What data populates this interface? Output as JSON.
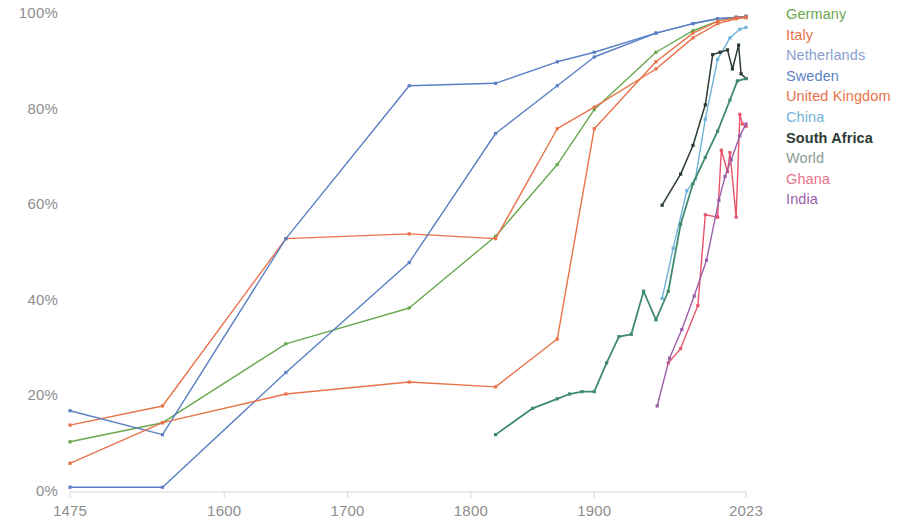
{
  "chart_data": {
    "type": "line",
    "title": "",
    "subtitle": "",
    "xlabel": "",
    "ylabel": "",
    "xlim": [
      1475,
      2023
    ],
    "ylim": [
      0,
      100
    ],
    "grid": false,
    "axis_line_color": "#d8d8d8",
    "tick_label_color": "#8e8e8e",
    "legend_position": "right",
    "x_ticks": [
      1475,
      1600,
      1700,
      1800,
      1900,
      2023
    ],
    "x_tick_labels": [
      "1475",
      "1600",
      "1700",
      "1800",
      "1900",
      "2023"
    ],
    "y_ticks": [
      0,
      20,
      40,
      60,
      80,
      100
    ],
    "y_tick_labels": [
      "0%",
      "20%",
      "40%",
      "60%",
      "80%",
      "100%"
    ],
    "series": [
      {
        "name": "Germany",
        "color": "#6aa84f",
        "width": 1.4,
        "x": [
          1475,
          1550,
          1650,
          1750,
          1820,
          1870,
          1900,
          1950,
          1980,
          2000,
          2015,
          2023
        ],
        "y": [
          10.5,
          14.5,
          31.0,
          38.5,
          53.5,
          68.5,
          80.0,
          92.0,
          96.5,
          98.5,
          99.3,
          99.5
        ]
      },
      {
        "name": "Italy",
        "color": "#e8734a",
        "width": 1.4,
        "x": [
          1475,
          1550,
          1650,
          1750,
          1820,
          1870,
          1900,
          1950,
          1980,
          2000,
          2015,
          2023
        ],
        "y": [
          14.0,
          18.0,
          53.0,
          54.0,
          53.0,
          76.0,
          80.5,
          88.5,
          95.0,
          98.0,
          99.0,
          99.2
        ]
      },
      {
        "name": "Netherlands",
        "color": "#5b7fc4",
        "width": 1.4,
        "x": [
          1475,
          1550,
          1650,
          1750,
          1820,
          1870,
          1900,
          1950,
          1980,
          2000,
          2015,
          2023
        ],
        "y": [
          17.0,
          12.0,
          53.0,
          85.0,
          85.5,
          90.0,
          92.0,
          96.0,
          98.0,
          99.0,
          99.3,
          99.5
        ]
      },
      {
        "name": "Sweden",
        "color": "#5b7fc4",
        "width": 1.4,
        "x": [
          1475,
          1550,
          1650,
          1750,
          1820,
          1870,
          1900,
          1950,
          1980,
          2000,
          2015,
          2023
        ],
        "y": [
          1.0,
          1.0,
          25.0,
          48.0,
          75.0,
          85.0,
          91.0,
          96.0,
          98.0,
          99.0,
          99.3,
          99.5
        ]
      },
      {
        "name": "United Kingdom",
        "color": "#e8734a",
        "width": 1.4,
        "x": [
          1475,
          1550,
          1650,
          1750,
          1820,
          1870,
          1900,
          1950,
          1980,
          2000,
          2015,
          2023
        ],
        "y": [
          6.0,
          14.5,
          20.5,
          23.0,
          22.0,
          32.0,
          76.0,
          90.0,
          96.0,
          98.5,
          99.2,
          99.4
        ]
      },
      {
        "name": "China",
        "color": "#6fb3d9",
        "width": 1.4,
        "x": [
          1955,
          1964,
          1975,
          1982,
          1990,
          2000,
          2010,
          2018,
          2023
        ],
        "y": [
          40.5,
          51.0,
          63.0,
          65.5,
          78.0,
          90.5,
          95.0,
          96.8,
          97.2
        ]
      },
      {
        "name": "South Africa",
        "color": "#2c3b33",
        "width": 1.5,
        "x": [
          1955,
          1970,
          1980,
          1990,
          1996,
          2002,
          2008,
          2012,
          2017,
          2019,
          2023
        ],
        "y": [
          60.0,
          66.5,
          72.5,
          81.0,
          91.5,
          92.0,
          92.5,
          88.5,
          93.5,
          87.5,
          86.5
        ]
      },
      {
        "name": "World",
        "color": "#3e8a6e",
        "width": 1.8,
        "x": [
          1820,
          1850,
          1870,
          1880,
          1890,
          1900,
          1910,
          1920,
          1930,
          1940,
          1950,
          1960,
          1970,
          1980,
          1990,
          2000,
          2010,
          2016,
          2023
        ],
        "y": [
          12.0,
          17.5,
          19.5,
          20.5,
          21.0,
          21.0,
          27.0,
          32.5,
          33.0,
          42.0,
          36.0,
          42.0,
          56.0,
          64.5,
          70.0,
          75.5,
          82.0,
          86.0,
          86.5
        ]
      },
      {
        "name": "Ghana",
        "color": "#e8536d",
        "width": 1.4,
        "x": [
          1960,
          1970,
          1984,
          1990,
          2000,
          2003,
          2008,
          2010,
          2015,
          2018,
          2020,
          2023
        ],
        "y": [
          27.0,
          30.0,
          39.0,
          58.0,
          57.5,
          71.5,
          67.0,
          71.0,
          57.5,
          79.0,
          77.0,
          76.5
        ]
      },
      {
        "name": "India",
        "color": "#9b5fa8",
        "width": 1.4,
        "x": [
          1951,
          1961,
          1971,
          1981,
          1991,
          2001,
          2006,
          2011,
          2018,
          2023
        ],
        "y": [
          18.0,
          28.0,
          34.0,
          41.0,
          48.5,
          61.0,
          66.0,
          69.5,
          74.5,
          77.0
        ]
      }
    ]
  },
  "legend": {
    "items": [
      {
        "label": "Germany",
        "color": "#6aa84f"
      },
      {
        "label": "Italy",
        "color": "#e8734a"
      },
      {
        "label": "Netherlands",
        "color": "#8a9fd0"
      },
      {
        "label": "Sweden",
        "color": "#5b7fc4"
      },
      {
        "label": "United Kingdom",
        "color": "#e8734a"
      },
      {
        "label": "China",
        "color": "#6fb3d9"
      },
      {
        "label": "South Africa",
        "color": "#2c3b33"
      },
      {
        "label": "World",
        "color": "#8a9b92"
      },
      {
        "label": "Ghana",
        "color": "#e8738a"
      },
      {
        "label": "India",
        "color": "#9b5fa8"
      }
    ]
  }
}
